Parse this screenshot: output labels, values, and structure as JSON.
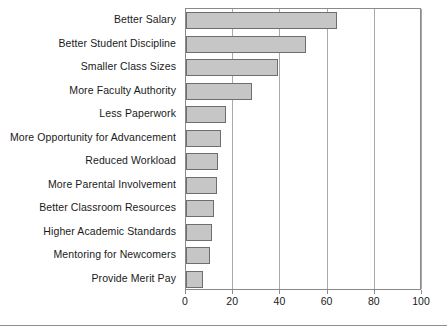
{
  "chart_data": {
    "type": "bar",
    "orientation": "horizontal",
    "title": "",
    "subtitle": "",
    "xlabel": "",
    "ylabel": "",
    "xlim": [
      0,
      100
    ],
    "xticks": [
      0,
      20,
      40,
      60,
      80,
      100
    ],
    "xticklabels": [
      "0",
      "20",
      "40",
      "60",
      "80",
      "100"
    ],
    "grid": "vertical",
    "legend": "none",
    "bar_color": "#c6c6c6",
    "bar_edge_color": "#6e6e6e",
    "axis_color": "#8a8a8a",
    "categories": [
      "Better Salary",
      "Better Student Discipline",
      "Smaller Class Sizes",
      "More Faculty Authority",
      "Less Paperwork",
      "More Opportunity for Advancement",
      "Reduced Workload",
      "More Parental Involvement",
      "Better Classroom Resources",
      "Higher Academic Standards",
      "Mentoring for Newcomers",
      "Provide Merit Pay"
    ],
    "values": [
      64,
      51,
      39,
      28,
      17,
      15,
      13.5,
      13,
      12,
      11,
      10,
      7
    ]
  }
}
